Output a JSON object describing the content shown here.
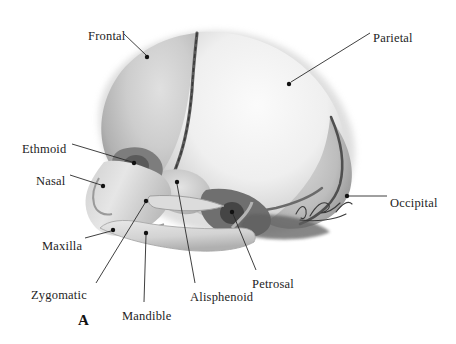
{
  "figure": {
    "panel_letter": "A",
    "signature": "artist-signature",
    "style": "grayscale medical illustration",
    "colors": {
      "background": "#ffffff",
      "bone_light": "#f3f3f3",
      "bone_mid": "#c9c9c9",
      "bone_dark": "#8f8f8f",
      "suture": "#4a4a4a",
      "shadow": "#5d5d5d",
      "label_text": "#1d1d1d",
      "leader_line": "#2a2a2a"
    }
  },
  "labels": [
    {
      "id": "frontal",
      "text": "Frontal",
      "text_x": 88,
      "text_y": 30,
      "anchor": "start",
      "dot_x": 147,
      "dot_y": 57,
      "line": [
        [
          124,
          34
        ],
        [
          146,
          55
        ]
      ]
    },
    {
      "id": "parietal",
      "text": "Parietal",
      "text_x": 373,
      "text_y": 32,
      "anchor": "start",
      "dot_x": 289,
      "dot_y": 84,
      "line": [
        [
          370,
          33
        ],
        [
          291,
          82
        ]
      ]
    },
    {
      "id": "ethmoid",
      "text": "Ethmoid",
      "text_x": 22,
      "text_y": 143,
      "anchor": "start",
      "dot_x": 134,
      "dot_y": 163,
      "line": [
        [
          72,
          144
        ],
        [
          132,
          162
        ]
      ]
    },
    {
      "id": "nasal",
      "text": "Nasal",
      "text_x": 36,
      "text_y": 175,
      "anchor": "start",
      "dot_x": 103,
      "dot_y": 186,
      "line": [
        [
          70,
          175
        ],
        [
          101,
          185
        ]
      ]
    },
    {
      "id": "occipital",
      "text": "Occipital",
      "text_x": 390,
      "text_y": 197,
      "anchor": "start",
      "dot_x": 347,
      "dot_y": 196,
      "line": [
        [
          387,
          196
        ],
        [
          349,
          196
        ]
      ]
    },
    {
      "id": "maxilla",
      "text": "Maxilla",
      "text_x": 42,
      "text_y": 240,
      "anchor": "start",
      "dot_x": 113,
      "dot_y": 230,
      "line": [
        [
          85,
          238
        ],
        [
          111,
          231
        ]
      ]
    },
    {
      "id": "zygomatic",
      "text": "Zygomatic",
      "text_x": 31,
      "text_y": 289,
      "anchor": "start",
      "dot_x": 146,
      "dot_y": 201,
      "line": [
        [
          96,
          283
        ],
        [
          145,
          203
        ]
      ]
    },
    {
      "id": "mandible",
      "text": "Mandible",
      "text_x": 122,
      "text_y": 310,
      "anchor": "start",
      "dot_x": 146,
      "dot_y": 233,
      "line": [
        [
          144,
          302
        ],
        [
          146,
          235
        ]
      ]
    },
    {
      "id": "alisphenoid",
      "text": "Alisphenoid",
      "text_x": 190,
      "text_y": 291,
      "anchor": "start",
      "dot_x": 177,
      "dot_y": 182,
      "line": [
        [
          195,
          283
        ],
        [
          177,
          184
        ]
      ]
    },
    {
      "id": "petrosal",
      "text": "Petrosal",
      "text_x": 252,
      "text_y": 278,
      "anchor": "start",
      "dot_x": 232,
      "dot_y": 212,
      "line": [
        [
          256,
          270
        ],
        [
          233,
          214
        ]
      ]
    }
  ]
}
